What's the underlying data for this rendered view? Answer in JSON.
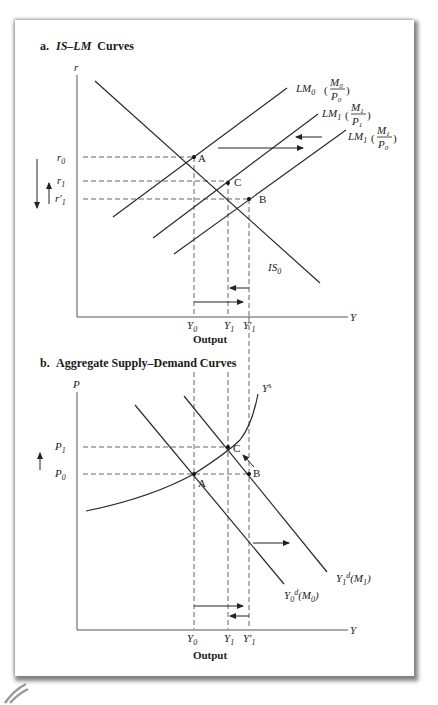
{
  "panel_a": {
    "title_prefix": "a.",
    "title_italic": "IS–LM",
    "title_suffix": "Curves",
    "y_axis_label": "r",
    "x_axis_label": "Y",
    "axis_title": "Output",
    "curves": {
      "is": {
        "main": "IS",
        "sub": "0"
      },
      "lm0": {
        "main": "LM",
        "sub": "0",
        "num": "M",
        "num_sub": "0",
        "den": "P",
        "den_sub": "0"
      },
      "lm1a": {
        "main": "LM",
        "sub": "1",
        "num": "M",
        "num_sub": "1",
        "den": "P",
        "den_sub": "1"
      },
      "lm1b": {
        "main": "LM",
        "sub": "1",
        "num": "M",
        "num_sub": "1",
        "den": "P",
        "den_sub": "0"
      }
    },
    "points": {
      "a": "A",
      "b": "B",
      "c": "C"
    },
    "y_ticks": [
      {
        "main": "r",
        "sub": "0"
      },
      {
        "main": "r",
        "sub": "1"
      },
      {
        "main": "r′",
        "sub": "1"
      }
    ],
    "x_ticks": [
      {
        "main": "Y",
        "sub": "0"
      },
      {
        "main": "Y",
        "sub": "1"
      },
      {
        "main": "Y′",
        "sub": "1"
      }
    ]
  },
  "panel_b": {
    "title_prefix": "b.",
    "title_text": "Aggregate Supply–Demand Curves",
    "y_axis_label": "P",
    "x_axis_label": "Y",
    "axis_title": "Output",
    "curves": {
      "supply": {
        "main": "Y",
        "sup": "s"
      },
      "demand0": {
        "main": "Y",
        "sub": "0",
        "sup": "d",
        "arg": "(M",
        "arg_sub": "0",
        "close": ")"
      },
      "demand1": {
        "main": "Y",
        "sub": "1",
        "sup": "d",
        "arg": "(M",
        "arg_sub": "1",
        "close": ")"
      }
    },
    "points": {
      "a": "A",
      "b": "B",
      "c": "C"
    },
    "y_ticks": [
      {
        "main": "P",
        "sub": "1"
      },
      {
        "main": "P",
        "sub": "0"
      }
    ],
    "x_ticks": [
      {
        "main": "Y",
        "sub": "0"
      },
      {
        "main": "Y",
        "sub": "1"
      },
      {
        "main": "Y′",
        "sub": "1"
      }
    ]
  },
  "colors": {
    "line": "#2a2a2a",
    "axis": "#555555",
    "card_shadow": "#5a5a5a",
    "background": "#ffffff"
  }
}
